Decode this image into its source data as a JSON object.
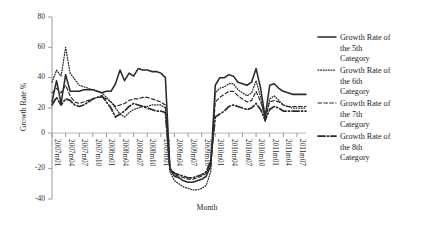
{
  "chart_data": {
    "type": "line",
    "title": "",
    "xlabel": "Month",
    "ylabel": "Growth Rate %",
    "ylim": [
      -40,
      80
    ],
    "yticks": [
      80,
      60,
      40,
      20,
      0,
      -20,
      -40
    ],
    "ytick_labels": [
      "80",
      "60",
      "40",
      "20",
      "0",
      "-20",
      "-40"
    ],
    "grid": false,
    "legend_position": "right",
    "xtick_labels": [
      "2007m01",
      "2007m04",
      "2007m07",
      "2007m10",
      "2008m01",
      "2008m04",
      "2008m07",
      "2008m10",
      "2009m01",
      "2009m04",
      "2009m07",
      "2009m10",
      "2010m01",
      "2010m04",
      "2010m07",
      "2010m10",
      "2011m01",
      "2011m04",
      "2011m07"
    ],
    "x": [
      "2007m01",
      "2007m02",
      "2007m03",
      "2007m04",
      "2007m05",
      "2007m06",
      "2007m07",
      "2007m08",
      "2007m09",
      "2007m10",
      "2007m11",
      "2007m12",
      "2008m01",
      "2008m02",
      "2008m03",
      "2008m04",
      "2008m05",
      "2008m06",
      "2008m07",
      "2008m08",
      "2008m09",
      "2008m10",
      "2008m11",
      "2008m12",
      "2009m01",
      "2009m02",
      "2009m03",
      "2009m04",
      "2009m05",
      "2009m06",
      "2009m07",
      "2009m08",
      "2009m09",
      "2009m10",
      "2009m11",
      "2009m12",
      "2010m01",
      "2010m02",
      "2010m03",
      "2010m04",
      "2010m05",
      "2010m06",
      "2010m07",
      "2010m08",
      "2010m09",
      "2010m10",
      "2010m11",
      "2010m12",
      "2011m01",
      "2011m02",
      "2011m03",
      "2011m04",
      "2011m05",
      "2011m06",
      "2011m07",
      "2011m08",
      "2011m09"
    ],
    "series": [
      {
        "name": "Growth Rate of the 5th Category",
        "style": "solid",
        "values": [
          24,
          38,
          23,
          42,
          31,
          31,
          31,
          32,
          32,
          32,
          31,
          30,
          31,
          31,
          36,
          45,
          38,
          43,
          41,
          46,
          45,
          45,
          44,
          44,
          43,
          40,
          -20,
          -25,
          -26,
          -28,
          -29,
          -29,
          -28,
          -27,
          -25,
          -18,
          35,
          40,
          40,
          42,
          41,
          37,
          36,
          35,
          37,
          46,
          33,
          14,
          35,
          36,
          33,
          31,
          30,
          29,
          29,
          29,
          29
        ]
      },
      {
        "name": "Growth Rate of the 6th Category",
        "style": "dotted",
        "values": [
          37,
          45,
          41,
          60,
          43,
          39,
          35,
          34,
          33,
          32,
          31,
          30,
          27,
          24,
          20,
          16,
          14,
          17,
          19,
          20,
          21,
          21,
          22,
          22,
          22,
          20,
          -22,
          -28,
          -30,
          -32,
          -33,
          -34,
          -34,
          -33,
          -31,
          -22,
          30,
          33,
          34,
          36,
          36,
          32,
          30,
          28,
          30,
          38,
          27,
          11,
          26,
          28,
          25,
          22,
          21,
          20,
          20,
          20,
          20
        ]
      },
      {
        "name": "Growth Rate of the 7th Category",
        "style": "dashed",
        "values": [
          30,
          33,
          30,
          35,
          28,
          24,
          23,
          24,
          25,
          26,
          27,
          27,
          26,
          24,
          21,
          22,
          23,
          25,
          26,
          26,
          27,
          27,
          26,
          25,
          24,
          22,
          -21,
          -24,
          -25,
          -26,
          -27,
          -27,
          -26,
          -25,
          -23,
          -16,
          24,
          27,
          29,
          31,
          31,
          28,
          26,
          24,
          25,
          31,
          24,
          15,
          24,
          25,
          24,
          22,
          21,
          21,
          21,
          21,
          21
        ]
      },
      {
        "name": "Growth Rate of the 8th Category",
        "style": "dash-dot",
        "values": [
          22,
          27,
          22,
          26,
          25,
          22,
          21,
          22,
          24,
          26,
          27,
          28,
          24,
          20,
          14,
          16,
          18,
          21,
          23,
          22,
          21,
          20,
          19,
          18,
          18,
          17,
          -20,
          -23,
          -24,
          -25,
          -26,
          -26,
          -25,
          -24,
          -22,
          -15,
          14,
          16,
          18,
          21,
          22,
          21,
          20,
          19,
          20,
          23,
          19,
          12,
          19,
          21,
          20,
          18,
          18,
          18,
          18,
          18,
          18
        ]
      }
    ]
  },
  "legend": {
    "entries": [
      {
        "label_line1": "Growth Rate of",
        "label_line2": "the 5th",
        "label_line3": "Category",
        "style": "solid"
      },
      {
        "label_line1": "Growth Rate of",
        "label_line2": "the 6th",
        "label_line3": "Category",
        "style": "dotted"
      },
      {
        "label_line1": "Growth Rate of",
        "label_line2": "the 7th",
        "label_line3": "Category",
        "style": "dashed"
      },
      {
        "label_line1": "Growth Rate of",
        "label_line2": "the 8th",
        "label_line3": "Category",
        "style": "dash-dot"
      }
    ]
  },
  "colors": {
    "line": "#2a2a2a",
    "axis": "#9a9a9a",
    "text": "#1f1f1f",
    "background": "#ffffff"
  }
}
